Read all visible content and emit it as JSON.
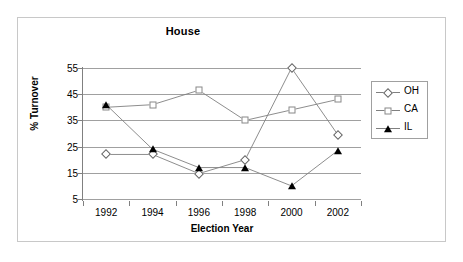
{
  "chart_data": {
    "type": "line",
    "title": "House",
    "xlabel": "Election Year",
    "ylabel": "% Turnover",
    "categories": [
      "1992",
      "1994",
      "1996",
      "1998",
      "2000",
      "2002"
    ],
    "x": [
      1992,
      1994,
      1996,
      1998,
      2000,
      2002
    ],
    "xlim": [
      1991,
      2003
    ],
    "ylim": [
      5,
      55
    ],
    "yticks": [
      5,
      15,
      25,
      35,
      45,
      55
    ],
    "ytick_labels": [
      "5",
      "15",
      "25",
      "35",
      "45",
      "55"
    ],
    "grid": "horizontal",
    "legend_position": "right",
    "series": [
      {
        "name": "OH",
        "marker": "open-diamond",
        "values": [
          22,
          22,
          14.7,
          20,
          55,
          29.5
        ]
      },
      {
        "name": "CA",
        "marker": "open-square",
        "values": [
          40,
          41,
          46.5,
          35,
          39,
          43
        ]
      },
      {
        "name": "IL",
        "marker": "filled-triangle",
        "values": [
          41,
          24,
          17,
          17,
          10,
          23.5
        ]
      }
    ],
    "colors": {
      "line": "#808080",
      "grid": "#a0a0a0",
      "axis": "#808080",
      "text": "#000000",
      "background": "#ffffff",
      "frame": "#c8c8c8"
    }
  }
}
